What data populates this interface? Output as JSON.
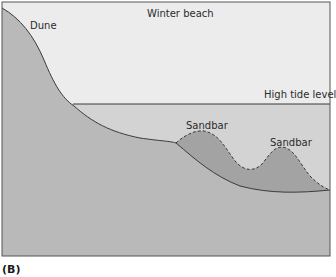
{
  "figure": {
    "panel_label": "(B)",
    "title": "Winter beach",
    "labels": {
      "dune": "Dune",
      "high_tide": "High tide level",
      "sandbar_1": "Sandbar",
      "sandbar_2": "Sandbar"
    },
    "colors": {
      "sky": "#ececec",
      "water": "#d3d3d3",
      "land": "#b9b9b9",
      "sandbar": "#a3a3a3",
      "outline": "#3a3a3a",
      "background": "#ffffff"
    }
  }
}
